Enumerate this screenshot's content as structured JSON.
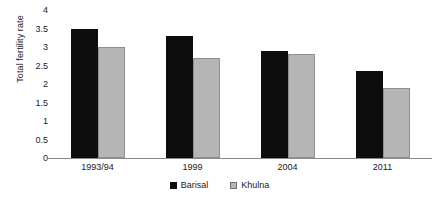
{
  "chart_data": {
    "type": "bar",
    "title": "",
    "xlabel": "",
    "ylabel": "Total fertility rate",
    "categories": [
      "1993/94",
      "1999",
      "2004",
      "2011"
    ],
    "series": [
      {
        "name": "Barisal",
        "color": "#0d0d0d",
        "values": [
          3.5,
          3.3,
          2.9,
          2.35
        ]
      },
      {
        "name": "Khulna",
        "color": "#b5b5b5",
        "values": [
          3.0,
          2.7,
          2.8,
          1.9
        ]
      }
    ],
    "ylim": [
      0,
      4
    ],
    "yticks": [
      "0",
      "0.5",
      "1",
      "1.5",
      "2",
      "2.5",
      "3",
      "3.5",
      "4"
    ],
    "ytick_values": [
      0,
      0.5,
      1,
      1.5,
      2,
      2.5,
      3,
      3.5,
      4
    ],
    "grid": false,
    "legend_position": "bottom-center"
  }
}
